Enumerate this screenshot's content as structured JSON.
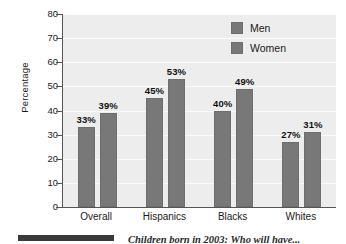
{
  "chart_data": {
    "type": "bar",
    "title": "",
    "xlabel": "",
    "ylabel": "Percentage",
    "ylim": [
      0,
      80
    ],
    "ytick_step": 10,
    "yticks": [
      80,
      70,
      60,
      50,
      40,
      30,
      20,
      10,
      0
    ],
    "grid": true,
    "legend_position": "top-right",
    "categories": [
      "Overall",
      "Hispanics",
      "Blacks",
      "Whites"
    ],
    "series": [
      {
        "name": "Men",
        "values": [
          33,
          45,
          40,
          27
        ],
        "labels": [
          "33%",
          "45%",
          "40%",
          "27%"
        ],
        "color": "#787878"
      },
      {
        "name": "Women",
        "values": [
          39,
          53,
          49,
          31
        ],
        "labels": [
          "39%",
          "53%",
          "49%",
          "31%"
        ],
        "color": "#787878"
      }
    ]
  },
  "caption": {
    "text": "Children born in 2003: Who will have..."
  },
  "colors": {
    "bar": "#787878",
    "plot_background": "#ededed",
    "axis": "#555555",
    "gridline": "#fbfbfb"
  }
}
